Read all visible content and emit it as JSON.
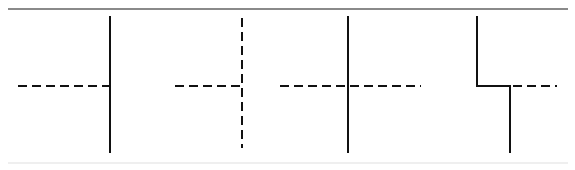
{
  "sheet": {
    "width": 575,
    "height": 170,
    "background": "#ffffff",
    "caption": "Line junction styles: solid and dashed line intersections"
  },
  "rules": {
    "top": {
      "label": "top-horizontal-rule",
      "x1": 8,
      "y1": 9,
      "x2": 568,
      "y2": 9,
      "color": "#8a8a8a",
      "width": 1.6
    },
    "bottom": {
      "label": "bottom-horizontal-rule",
      "x1": 8,
      "y1": 163,
      "x2": 568,
      "y2": 163,
      "color": "#efefef",
      "width": 1.2
    }
  },
  "style": {
    "stroke": "#111111",
    "solid_width": 2.4,
    "dash_width": 2.6,
    "dash_pattern": "9 5"
  },
  "figures": [
    {
      "id": "figure-1",
      "name": "solid-vertical-with-dashed-tee-left",
      "description": "Solid vertical line meeting a dashed horizontal line that terminates at the junction",
      "vertical": {
        "style": "solid",
        "x": 110,
        "y1": 16,
        "y2": 153
      },
      "horizontal": {
        "style": "dashed",
        "y": 86,
        "x1": 18,
        "x2": 111
      }
    },
    {
      "id": "figure-2",
      "name": "dashed-vertical-with-dashed-tee-left",
      "description": "Dashed vertical line meeting a dashed horizontal line that terminates at the junction",
      "vertical": {
        "style": "dashed",
        "x": 242,
        "y1": 18,
        "y2": 148
      },
      "horizontal": {
        "style": "dashed",
        "y": 86,
        "x1": 175,
        "x2": 243
      }
    },
    {
      "id": "figure-3",
      "name": "solid-vertical-crossed-by-dashed",
      "description": "Solid vertical line fully crossed by a continuous dashed horizontal line",
      "vertical": {
        "style": "solid",
        "x": 348,
        "y1": 16,
        "y2": 153
      },
      "horizontal": {
        "style": "dashed",
        "y": 86,
        "x1": 280,
        "x2": 421
      }
    },
    {
      "id": "figure-4",
      "name": "solid-vertical-jog-with-dashed-branch",
      "description": "Solid vertical line offset by a horizontal jog, with a dashed horizontal branch to the right",
      "jog": {
        "style": "solid",
        "upper_x": 477,
        "upper_y1": 16,
        "corner_y": 86,
        "lower_x": 510,
        "lower_y2": 153
      },
      "horizontal": {
        "style": "dashed",
        "y": 86,
        "x1": 513,
        "x2": 557
      }
    }
  ]
}
